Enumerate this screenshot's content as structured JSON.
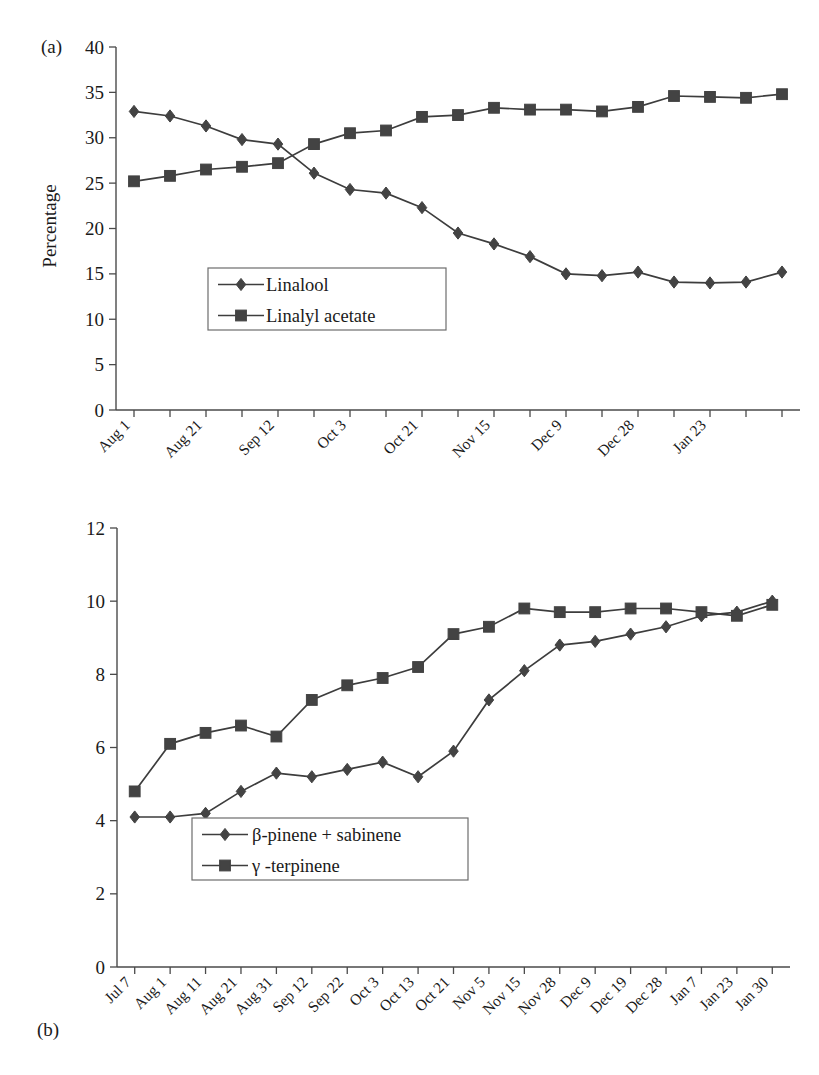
{
  "figure": {
    "panels": [
      {
        "tag": "(a)",
        "ylabel": "Percentage"
      },
      {
        "tag": "(b)",
        "ylabel": "Percentage"
      }
    ]
  },
  "chart_data": [
    {
      "type": "line",
      "panel": "(a)",
      "title": "",
      "xlabel": "",
      "ylabel": "Percentage",
      "ylim": [
        0,
        40
      ],
      "yticks": [
        0,
        5,
        10,
        15,
        20,
        25,
        30,
        35,
        40
      ],
      "grid": false,
      "legend_position": "inside-lower-left",
      "categories": [
        "Aug 1",
        "",
        "Aug 21",
        "",
        "Sep 12",
        "",
        "Oct 3",
        "",
        "Oct 21",
        "",
        "Nov 15",
        "",
        "Dec 9",
        "",
        "Dec 28",
        "",
        "Jan 23",
        ""
      ],
      "tick_labels_visible": [
        "Aug 1",
        "Aug 21",
        "Sep 12",
        "Oct 3",
        "Oct 21",
        "Nov 15",
        "Dec 9",
        "Dec 28",
        "Jan 23"
      ],
      "series": [
        {
          "name": "Linalool",
          "marker": "diamond",
          "values": [
            32.9,
            32.4,
            31.3,
            29.8,
            29.3,
            26.1,
            24.3,
            23.9,
            22.3,
            19.5,
            18.3,
            16.9,
            15.0,
            14.8,
            15.2,
            14.1,
            14.0,
            14.1,
            15.2
          ]
        },
        {
          "name": "Linalyl acetate",
          "marker": "square",
          "values": [
            25.2,
            25.8,
            26.5,
            26.8,
            27.2,
            29.3,
            30.5,
            30.8,
            32.3,
            32.5,
            33.3,
            33.1,
            33.1,
            32.9,
            33.4,
            34.6,
            34.5,
            34.4,
            34.8
          ]
        }
      ]
    },
    {
      "type": "line",
      "panel": "(b)",
      "title": "",
      "xlabel": "",
      "ylabel": "Percentage",
      "ylim": [
        0,
        12
      ],
      "yticks": [
        0,
        2,
        4,
        6,
        8,
        10,
        12
      ],
      "grid": false,
      "legend_position": "inside-lower-left",
      "categories": [
        "Jul 7",
        "Aug 1",
        "Aug 11",
        "Aug 21",
        "Aug 31",
        "Sep 12",
        "Sep 22",
        "Oct 3",
        "Oct 13",
        "Oct 21",
        "Nov 5",
        "Nov 15",
        "Nov 28",
        "Dec 9",
        "Dec 19",
        "Dec 28",
        "Jan 7",
        "Jan 23",
        "Jan 30"
      ],
      "series": [
        {
          "name": "β-pinene + sabinene",
          "marker": "diamond",
          "values": [
            4.1,
            4.1,
            4.2,
            4.8,
            5.3,
            5.2,
            5.4,
            5.6,
            5.2,
            5.9,
            7.3,
            8.1,
            8.8,
            8.9,
            9.1,
            9.3,
            9.6,
            9.7,
            10.0
          ]
        },
        {
          "name": "γ -terpinene",
          "marker": "square",
          "values": [
            4.8,
            6.1,
            6.4,
            6.6,
            6.3,
            7.3,
            7.7,
            7.9,
            8.2,
            9.1,
            9.3,
            9.8,
            9.7,
            9.7,
            9.8,
            9.8,
            9.7,
            9.6,
            9.9
          ]
        }
      ]
    }
  ]
}
